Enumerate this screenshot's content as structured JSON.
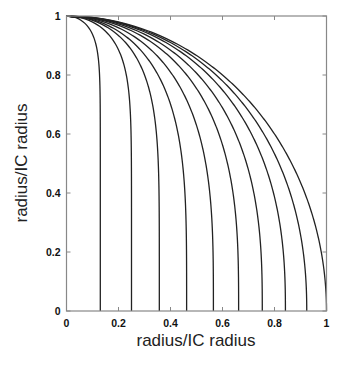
{
  "chart_data": {
    "type": "line",
    "title": "",
    "xlabel": "radius/IC radius",
    "ylabel": "radius/IC radius",
    "xlim": [
      0,
      1
    ],
    "ylim": [
      0,
      1
    ],
    "grid": false,
    "legend": null,
    "x_ticks": [
      "0",
      "0.2",
      "0.4",
      "0.6",
      "0.8",
      "1"
    ],
    "y_ticks": [
      "0",
      "0.2",
      "0.4",
      "0.6",
      "0.8",
      "1"
    ],
    "line_color": "#222222",
    "series": [
      {
        "name": "curve-1",
        "end_x": 0.13,
        "exponent": 14,
        "points": [
          [
            0,
            1
          ],
          [
            0.061,
            0.995
          ],
          [
            0.095,
            0.98
          ],
          [
            0.114,
            0.95
          ],
          [
            0.123,
            0.9
          ],
          [
            0.129,
            0.8
          ],
          [
            0.13,
            0.6
          ],
          [
            0.13,
            0.4
          ],
          [
            0.13,
            0.2
          ],
          [
            0.13,
            0
          ]
        ]
      },
      {
        "name": "curve-2",
        "end_x": 0.25,
        "exponent": 8.4,
        "points": [
          [
            0,
            1
          ],
          [
            0.1,
            0.995
          ],
          [
            0.14,
            0.98
          ],
          [
            0.19,
            0.95
          ],
          [
            0.222,
            0.9
          ],
          [
            0.228,
            0.8
          ],
          [
            0.248,
            0.6
          ],
          [
            0.25,
            0.4
          ],
          [
            0.25,
            0.2
          ],
          [
            0.25,
            0
          ]
        ]
      },
      {
        "name": "curve-3",
        "end_x": 0.357,
        "exponent": 5.5,
        "points": [
          [
            0,
            1
          ],
          [
            0.1,
            0.995
          ],
          [
            0.18,
            0.98
          ],
          [
            0.245,
            0.95
          ],
          [
            0.3,
            0.9
          ],
          [
            0.31,
            0.8
          ],
          [
            0.347,
            0.6
          ],
          [
            0.355,
            0.4
          ],
          [
            0.357,
            0.2
          ],
          [
            0.357,
            0
          ]
        ]
      },
      {
        "name": "curve-4",
        "end_x": 0.462,
        "exponent": 3.9,
        "points": [
          [
            0,
            1
          ],
          [
            0.11,
            0.995
          ],
          [
            0.2,
            0.98
          ],
          [
            0.29,
            0.95
          ],
          [
            0.36,
            0.9
          ],
          [
            0.351,
            0.8
          ],
          [
            0.417,
            0.6
          ],
          [
            0.445,
            0.4
          ],
          [
            0.455,
            0.2
          ],
          [
            0.462,
            0
          ]
        ]
      },
      {
        "name": "curve-5",
        "end_x": 0.565,
        "exponent": 3.3,
        "points": [
          [
            0,
            1
          ],
          [
            0.12,
            0.995
          ],
          [
            0.22,
            0.98
          ],
          [
            0.33,
            0.95
          ],
          [
            0.41,
            0.9
          ],
          [
            0.406,
            0.8
          ],
          [
            0.488,
            0.6
          ],
          [
            0.537,
            0.4
          ],
          [
            0.556,
            0.2
          ],
          [
            0.565,
            0
          ]
        ]
      },
      {
        "name": "curve-6",
        "end_x": 0.662,
        "exponent": 3.0,
        "points": [
          [
            0,
            1
          ],
          [
            0.13,
            0.995
          ],
          [
            0.24,
            0.98
          ],
          [
            0.36,
            0.95
          ],
          [
            0.46,
            0.9
          ],
          [
            0.457,
            0.8
          ],
          [
            0.546,
            0.6
          ],
          [
            0.62,
            0.4
          ],
          [
            0.652,
            0.2
          ],
          [
            0.662,
            0
          ]
        ]
      },
      {
        "name": "curve-7",
        "end_x": 0.753,
        "exponent": 2.7,
        "points": [
          [
            0,
            1
          ],
          [
            0.14,
            0.995
          ],
          [
            0.26,
            0.98
          ],
          [
            0.39,
            0.95
          ],
          [
            0.5,
            0.9
          ],
          [
            0.508,
            0.8
          ],
          [
            0.603,
            0.6
          ],
          [
            0.697,
            0.4
          ],
          [
            0.74,
            0.2
          ],
          [
            0.753,
            0
          ]
        ]
      },
      {
        "name": "curve-8",
        "end_x": 0.842,
        "exponent": 2.45,
        "points": [
          [
            0,
            1
          ],
          [
            0.145,
            0.995
          ],
          [
            0.27,
            0.98
          ],
          [
            0.41,
            0.95
          ],
          [
            0.535,
            0.9
          ],
          [
            0.562,
            0.8
          ],
          [
            0.661,
            0.6
          ],
          [
            0.767,
            0.4
          ],
          [
            0.822,
            0.2
          ],
          [
            0.842,
            0
          ]
        ]
      },
      {
        "name": "curve-9",
        "end_x": 0.924,
        "exponent": 2.2,
        "points": [
          [
            0,
            1
          ],
          [
            0.15,
            0.995
          ],
          [
            0.28,
            0.98
          ],
          [
            0.43,
            0.95
          ],
          [
            0.565,
            0.9
          ],
          [
            0.62,
            0.8
          ],
          [
            0.72,
            0.6
          ],
          [
            0.838,
            0.4
          ],
          [
            0.903,
            0.2
          ],
          [
            0.924,
            0
          ]
        ]
      },
      {
        "name": "curve-10",
        "end_x": 1.0,
        "exponent": 2.0,
        "points": [
          [
            0,
            1
          ],
          [
            0.1,
            0.995
          ],
          [
            0.2,
            0.98
          ],
          [
            0.312,
            0.95
          ],
          [
            0.436,
            0.9
          ],
          [
            0.6,
            0.8
          ],
          [
            0.8,
            0.6
          ],
          [
            0.917,
            0.4
          ],
          [
            0.98,
            0.2
          ],
          [
            1.0,
            0
          ]
        ]
      }
    ]
  },
  "layout": {
    "plot_left": 66.5,
    "plot_right": 326.5,
    "plot_top": 16,
    "plot_bottom": 311
  }
}
